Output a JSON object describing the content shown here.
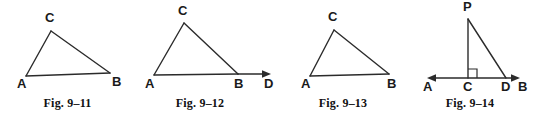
{
  "page": {
    "background_color": "#ffffff",
    "line_color": "#2b2b2b",
    "label_color": "#1a1a1a"
  },
  "figures": [
    {
      "id": "fig-9-11",
      "caption": "Fig. 9–11",
      "description": "Triangle ABC",
      "vertices": [
        {
          "name": "A",
          "label": "A",
          "x": 26,
          "y": 76,
          "label_x": 17,
          "label_y": 88
        },
        {
          "name": "B",
          "label": "B",
          "x": 110,
          "y": 73,
          "label_x": 112,
          "label_y": 86
        },
        {
          "name": "C",
          "label": "C",
          "x": 51,
          "y": 31,
          "label_x": 45,
          "label_y": 22
        }
      ],
      "edges": [
        {
          "from": "A",
          "to": "C"
        },
        {
          "from": "C",
          "to": "B"
        },
        {
          "from": "A",
          "to": "B"
        }
      ],
      "rays": [],
      "right_angle": null
    },
    {
      "id": "fig-9-12",
      "caption": "Fig. 9–12",
      "description": "Triangle ABC with side AB extended to D",
      "vertices": [
        {
          "name": "A",
          "label": "A",
          "x": 14,
          "y": 75,
          "label_x": 5,
          "label_y": 88
        },
        {
          "name": "B",
          "label": "B",
          "x": 98,
          "y": 74,
          "label_x": 94,
          "label_y": 88
        },
        {
          "name": "C",
          "label": "C",
          "x": 44,
          "y": 23,
          "label_x": 38,
          "label_y": 15
        },
        {
          "name": "D",
          "label": "D",
          "x": 128,
          "y": 74,
          "label_x": 124,
          "label_y": 88
        }
      ],
      "edges": [
        {
          "from": "A",
          "to": "C"
        },
        {
          "from": "C",
          "to": "B"
        },
        {
          "from": "A",
          "to": "B"
        }
      ],
      "rays": [
        {
          "from": "B",
          "to": "D",
          "arrow_at_end": true
        }
      ],
      "right_angle": null
    },
    {
      "id": "fig-9-13",
      "caption": "Fig. 9–13",
      "description": "Triangle ABC",
      "vertices": [
        {
          "name": "A",
          "label": "A",
          "x": 22,
          "y": 76,
          "label_x": 13,
          "label_y": 88
        },
        {
          "name": "B",
          "label": "B",
          "x": 101,
          "y": 74,
          "label_x": 99,
          "label_y": 88
        },
        {
          "name": "C",
          "label": "C",
          "x": 46,
          "y": 30,
          "label_x": 40,
          "label_y": 21
        }
      ],
      "edges": [
        {
          "from": "A",
          "to": "C"
        },
        {
          "from": "C",
          "to": "B"
        },
        {
          "from": "A",
          "to": "B"
        }
      ],
      "rays": [],
      "right_angle": null
    },
    {
      "id": "fig-9-14",
      "caption": "Fig. 9–14",
      "description": "Right triangle PCD on line AB with right angle at C",
      "vertices": [
        {
          "name": "P",
          "label": "P",
          "x": 58,
          "y": 19,
          "label_x": 53,
          "label_y": 11
        },
        {
          "name": "A",
          "label": "A",
          "x": 17,
          "y": 78,
          "label_x": 13,
          "label_y": 91
        },
        {
          "name": "C",
          "label": "C",
          "x": 58,
          "y": 78,
          "label_x": 53,
          "label_y": 91
        },
        {
          "name": "D",
          "label": "D",
          "x": 96,
          "y": 78,
          "label_x": 91,
          "label_y": 91
        },
        {
          "name": "B",
          "label": "B",
          "x": 112,
          "y": 78,
          "label_x": 108,
          "label_y": 91
        }
      ],
      "edges": [
        {
          "from": "P",
          "to": "C"
        },
        {
          "from": "P",
          "to": "D"
        }
      ],
      "rays": [
        {
          "from": "C",
          "to": "A",
          "arrow_at_end": true
        },
        {
          "from": "C",
          "to": "B",
          "arrow_at_end": true
        }
      ],
      "right_angle": {
        "at": "C",
        "size": 8,
        "opens": "upper-right"
      }
    }
  ]
}
